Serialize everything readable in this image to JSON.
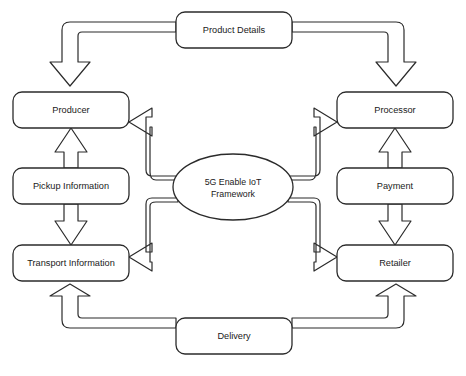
{
  "diagram": {
    "background_color": "#ffffff",
    "stroke_color": "#2b2b2b",
    "fill_color": "#ffffff",
    "hub": {
      "name": "iot-framework-hub",
      "label_line1": "5G Enable IoT",
      "label_line2": "Framework",
      "shape": "ellipse",
      "cx": 233,
      "cy": 187,
      "rx": 60,
      "ry": 33
    },
    "nodes": [
      {
        "id": "product-details",
        "label": "Product Details",
        "x": 176,
        "y": 12,
        "width": 116,
        "height": 36
      },
      {
        "id": "producer",
        "label": "Producer",
        "x": 13,
        "y": 92,
        "width": 116,
        "height": 36
      },
      {
        "id": "pickup-information",
        "label": "Pickup Information",
        "x": 13,
        "y": 168,
        "width": 116,
        "height": 36
      },
      {
        "id": "transport-information",
        "label": "Transport Information",
        "x": 13,
        "y": 245,
        "width": 116,
        "height": 36
      },
      {
        "id": "processor",
        "label": "Processor",
        "x": 337,
        "y": 92,
        "width": 116,
        "height": 36
      },
      {
        "id": "payment",
        "label": "Payment",
        "x": 337,
        "y": 168,
        "width": 116,
        "height": 36
      },
      {
        "id": "retailer",
        "label": "Retailer",
        "x": 337,
        "y": 245,
        "width": 116,
        "height": 36
      },
      {
        "id": "delivery",
        "label": "Delivery",
        "x": 176,
        "y": 318,
        "width": 116,
        "height": 36
      }
    ],
    "edges": [
      {
        "id": "product-details-to-producer",
        "from": "product-details",
        "to": "producer",
        "style": "elbow-block-arrow"
      },
      {
        "id": "product-details-to-processor",
        "from": "product-details",
        "to": "processor",
        "style": "elbow-block-arrow"
      },
      {
        "id": "pickup-information-to-producer",
        "from": "pickup-information",
        "to": "producer",
        "style": "block-arrow-up"
      },
      {
        "id": "pickup-information-to-transport-information",
        "from": "pickup-information",
        "to": "transport-information",
        "style": "block-arrow-down"
      },
      {
        "id": "payment-to-processor",
        "from": "payment",
        "to": "processor",
        "style": "block-arrow-up"
      },
      {
        "id": "payment-to-retailer",
        "from": "payment",
        "to": "retailer",
        "style": "block-arrow-down"
      },
      {
        "id": "delivery-to-transport-information",
        "from": "delivery",
        "to": "transport-information",
        "style": "elbow-block-arrow"
      },
      {
        "id": "delivery-to-retailer",
        "from": "delivery",
        "to": "retailer",
        "style": "elbow-block-arrow"
      },
      {
        "id": "framework-to-producer",
        "from": "iot-framework-hub",
        "to": "producer",
        "style": "elbow-block-arrow"
      },
      {
        "id": "framework-to-transport-information",
        "from": "iot-framework-hub",
        "to": "transport-information",
        "style": "elbow-block-arrow"
      },
      {
        "id": "framework-to-processor",
        "from": "iot-framework-hub",
        "to": "processor",
        "style": "elbow-block-arrow"
      },
      {
        "id": "framework-to-retailer",
        "from": "iot-framework-hub",
        "to": "retailer",
        "style": "elbow-block-arrow"
      }
    ],
    "caption": ""
  }
}
